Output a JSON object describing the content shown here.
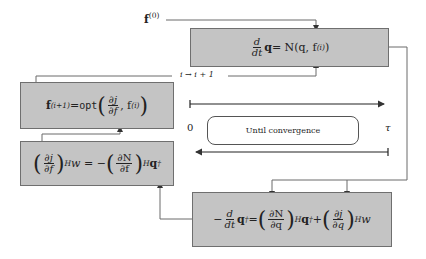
{
  "diagram": {
    "type": "flowchart",
    "labels": {
      "initial_guess": "f",
      "initial_guess_sup": "(0)",
      "iteration": "i → i + 1",
      "time_start": "0",
      "time_end": "τ",
      "loop": "Until convergence"
    },
    "boxes": {
      "forward": {
        "name": "forward-equation",
        "lhs_num": "d",
        "lhs_den": "dt",
        "lhs_var": "q",
        "rhs": " = N(q, f",
        "rhs_sup": "(i)",
        "rhs_close": ")"
      },
      "update": {
        "name": "optimization-update",
        "lhs": "f",
        "lhs_sup": "(i+1)",
        "eq": " = ",
        "op": "opt",
        "frac_num": "∂j",
        "frac_den": "∂f",
        "arg2": ", f",
        "arg2_sup": "(i)"
      },
      "gradient": {
        "name": "gradient-equation",
        "frac1_num": "∂j",
        "frac1_den": "∂f",
        "sup_H": "H",
        "mid": " w = − ",
        "frac2_num": "∂N",
        "frac2_den": "∂f",
        "tail": "q",
        "tail_sup": "†"
      },
      "adjoint": {
        "name": "adjoint-equation",
        "lhs_pre": "−",
        "lhs_num": "d",
        "lhs_den": "dt",
        "lhs_var": "q",
        "lhs_sup": "†",
        "eq": " = ",
        "frac1_num": "∂N",
        "frac1_den": "∂q",
        "sup_H": "H",
        "mid": "q",
        "mid_sup": "†",
        "plus": " + ",
        "frac2_num": "∂j",
        "frac2_den": "∂q",
        "tail": "w"
      }
    },
    "colors": {
      "box_fill": "#c4c4c4",
      "box_border": "#6f6f6f",
      "line": "#555555",
      "background": "#ffffff"
    }
  }
}
